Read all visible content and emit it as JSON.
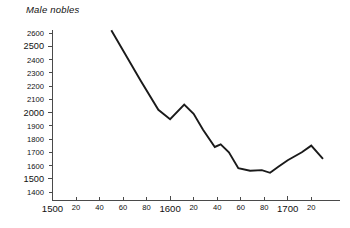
{
  "chart_data": {
    "type": "line",
    "title": "Male nobles",
    "xlabel": "",
    "ylabel": "",
    "grid": false,
    "legend": false,
    "xlim": [
      1500,
      1730
    ],
    "ylim": [
      1400,
      2650
    ],
    "x_tick_labels": [
      "1500",
      "20",
      "40",
      "60",
      "80",
      "1600",
      "20",
      "40",
      "60",
      "80",
      "1700",
      "20"
    ],
    "x_tick_values": [
      1500,
      1520,
      1540,
      1560,
      1580,
      1600,
      1620,
      1640,
      1660,
      1680,
      1700,
      1720
    ],
    "x_major_ticks": [
      1500,
      1600,
      1700
    ],
    "y_tick_labels": [
      "2600",
      "2500",
      "2400",
      "2300",
      "2200",
      "2100",
      "2000",
      "1900",
      "1800",
      "1700",
      "1600",
      "1500",
      "1400"
    ],
    "y_tick_values": [
      2600,
      2500,
      2400,
      2300,
      2200,
      2100,
      2000,
      1900,
      1800,
      1700,
      1600,
      1500,
      1400
    ],
    "y_major_ticks": [
      2500,
      2000,
      1500
    ],
    "series_name": "Male nobles",
    "line_color": "#1a1a1a",
    "x": [
      1550,
      1575,
      1590,
      1600,
      1612,
      1620,
      1628,
      1638,
      1643,
      1650,
      1658,
      1668,
      1678,
      1685,
      1692,
      1700,
      1712,
      1720,
      1730
    ],
    "values": [
      2620,
      2240,
      2020,
      1950,
      2060,
      1990,
      1870,
      1740,
      1760,
      1700,
      1580,
      1560,
      1565,
      1545,
      1590,
      1640,
      1700,
      1750,
      1650
    ]
  },
  "colors": {
    "axis": "#4a4a4a",
    "line": "#1a1a1a",
    "text": "#111111",
    "background": "#ffffff"
  }
}
